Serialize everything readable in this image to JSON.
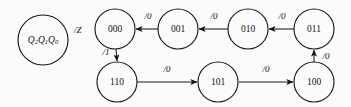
{
  "diagram": {
    "type": "finite-state-machine-state-diagram",
    "background_color": "#fbfbfb",
    "ink_color": "#1a1a1a",
    "legend": {
      "state_vars": "Q2Q1Q0",
      "state_var_base": "Q",
      "state_var_subs": [
        "2",
        "1",
        "0"
      ],
      "output_label": "/Z",
      "circle": {
        "cx": 43,
        "cy": 40,
        "r": 25
      },
      "output_pos": {
        "x": 74,
        "y": 31
      }
    },
    "nodes": [
      {
        "id": "s000",
        "label": "000",
        "cx": 115,
        "cy": 29,
        "r": 20
      },
      {
        "id": "s001",
        "label": "001",
        "cx": 178,
        "cy": 29,
        "r": 20
      },
      {
        "id": "s010",
        "label": "010",
        "cx": 248,
        "cy": 29,
        "r": 20
      },
      {
        "id": "s011",
        "label": "011",
        "cx": 314,
        "cy": 29,
        "r": 20
      },
      {
        "id": "s110",
        "label": "110",
        "cx": 117,
        "cy": 82,
        "r": 20
      },
      {
        "id": "s101",
        "label": "101",
        "cx": 218,
        "cy": 82,
        "r": 20
      },
      {
        "id": "s100",
        "label": "100",
        "cx": 314,
        "cy": 82,
        "r": 20
      }
    ],
    "edges": [
      {
        "id": "e001-000",
        "from": "001",
        "to": "000",
        "label": "/0",
        "x1": 158,
        "y1": 29,
        "x2": 136,
        "y2": 29,
        "label_x": 148,
        "label_y": 17
      },
      {
        "id": "e010-001",
        "from": "010",
        "to": "001",
        "label": "/0",
        "x1": 228,
        "y1": 29,
        "x2": 199,
        "y2": 29,
        "label_x": 214,
        "label_y": 17
      },
      {
        "id": "e011-010",
        "from": "011",
        "to": "010",
        "label": "/0",
        "x1": 294,
        "y1": 29,
        "x2": 269,
        "y2": 29,
        "label_x": 282,
        "label_y": 17
      },
      {
        "id": "e000-110",
        "from": "000",
        "to": "110",
        "label": "/1",
        "x1": 116,
        "y1": 49,
        "x2": 117,
        "y2": 61,
        "label_x": 106,
        "label_y": 53
      },
      {
        "id": "e110-101",
        "from": "110",
        "to": "101",
        "label": "/0",
        "x1": 137,
        "y1": 82,
        "x2": 197,
        "y2": 82,
        "label_x": 167,
        "label_y": 70
      },
      {
        "id": "e101-100",
        "from": "101",
        "to": "100",
        "label": "/0",
        "x1": 239,
        "y1": 82,
        "x2": 293,
        "y2": 82,
        "label_x": 266,
        "label_y": 70
      },
      {
        "id": "e100-011",
        "from": "100",
        "to": "011",
        "label": "/0",
        "x1": 314,
        "y1": 62,
        "x2": 314,
        "y2": 50,
        "label_x": 326,
        "label_y": 57
      }
    ]
  }
}
